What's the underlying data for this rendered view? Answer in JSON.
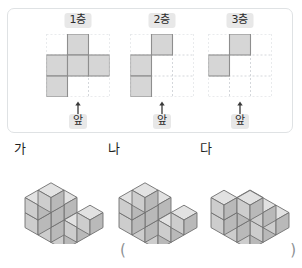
{
  "palette": {
    "panel_border": "#dfe2e4",
    "grid_dashed": "#c9cdd2",
    "cell_fill": "#cfcfcf",
    "cell_stroke": "#8e8e8e",
    "chip_bg": "#e8e8e8",
    "text": "#2b2b2b",
    "cube_top": "#e2e2e2",
    "cube_left": "#cdcdcd",
    "cube_right": "#b9b9b9",
    "cube_stroke": "#6f6f6f",
    "paren": "#8d9093"
  },
  "layers_panel": {
    "grid_size": 3,
    "front_arrow_icon": "up-arrow-icon",
    "columns": [
      {
        "title": "1층",
        "front_label": "앞",
        "filled_cells": [
          [
            0,
            1
          ],
          [
            1,
            0
          ],
          [
            1,
            1
          ],
          [
            1,
            2
          ],
          [
            2,
            0
          ]
        ]
      },
      {
        "title": "2층",
        "front_label": "앞",
        "filled_cells": [
          [
            0,
            1
          ],
          [
            1,
            0
          ],
          [
            2,
            0
          ]
        ]
      },
      {
        "title": "3층",
        "front_label": "앞",
        "filled_cells": [
          [
            0,
            1
          ],
          [
            1,
            0
          ]
        ]
      }
    ]
  },
  "figures": [
    {
      "label": "가",
      "voxels": [
        [
          0,
          0,
          0
        ],
        [
          1,
          0,
          0
        ],
        [
          2,
          0,
          0
        ],
        [
          0,
          1,
          0
        ],
        [
          0,
          2,
          0
        ],
        [
          0,
          0,
          1
        ],
        [
          0,
          1,
          1
        ],
        [
          0,
          0,
          2
        ],
        [
          0,
          1,
          2
        ],
        [
          1,
          1,
          2
        ]
      ]
    },
    {
      "label": "나",
      "voxels": [
        [
          0,
          0,
          0
        ],
        [
          1,
          0,
          0
        ],
        [
          2,
          0,
          0
        ],
        [
          0,
          1,
          0
        ],
        [
          0,
          2,
          0
        ],
        [
          0,
          0,
          1
        ],
        [
          0,
          1,
          1
        ],
        [
          0,
          0,
          2
        ],
        [
          0,
          1,
          2
        ],
        [
          1,
          1,
          2
        ]
      ]
    },
    {
      "label": "다",
      "voxels": [
        [
          0,
          0,
          0
        ],
        [
          1,
          0,
          0
        ],
        [
          2,
          0,
          0
        ],
        [
          0,
          1,
          0
        ],
        [
          0,
          2,
          0
        ],
        [
          0,
          0,
          1
        ],
        [
          0,
          1,
          1
        ],
        [
          2,
          0,
          1
        ],
        [
          0,
          0,
          2
        ],
        [
          0,
          1,
          2
        ],
        [
          2,
          0,
          2
        ]
      ]
    }
  ],
  "answer_blank": {
    "open_paren": "(",
    "close_paren": ")"
  }
}
